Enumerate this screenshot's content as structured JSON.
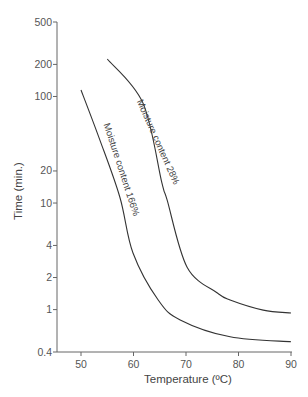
{
  "chart_data": {
    "type": "line",
    "title": "",
    "xlabel": "Temperature (ºC)",
    "ylabel": "Time (min.)",
    "xlim": [
      45.5,
      90
    ],
    "ylim": [
      0.4,
      500
    ],
    "yscale": "log",
    "grid": false,
    "legend": "none (curves labeled inline)",
    "x_ticks": [
      50,
      60,
      70,
      80,
      90
    ],
    "x_tick_labels": [
      "50",
      "60",
      "70",
      "80",
      "90"
    ],
    "y_ticks": [
      500,
      200,
      100,
      20,
      10,
      4,
      2,
      1,
      0.4
    ],
    "y_tick_labels": [
      "500",
      "200",
      "100",
      "20",
      "10",
      "4",
      "2",
      "1",
      "0.4"
    ],
    "series": [
      {
        "name": "Moisture content 166%",
        "label": "Moisture content 166%",
        "x": [
          50,
          53.6,
          57.4,
          59.9,
          64.7,
          68.9,
          78.4,
          90
        ],
        "y": [
          115,
          39,
          11.4,
          3.4,
          1.23,
          0.8,
          0.555,
          0.5
        ]
      },
      {
        "name": "Moisture content 28%",
        "label": "Moisture content 28%",
        "x": [
          55,
          61.8,
          65.4,
          66.4,
          70.2,
          75.9,
          78.4,
          84.7,
          90
        ],
        "y": [
          225,
          87,
          15.5,
          10.7,
          2.5,
          1.44,
          1.23,
          0.99,
          0.93
        ]
      }
    ]
  }
}
